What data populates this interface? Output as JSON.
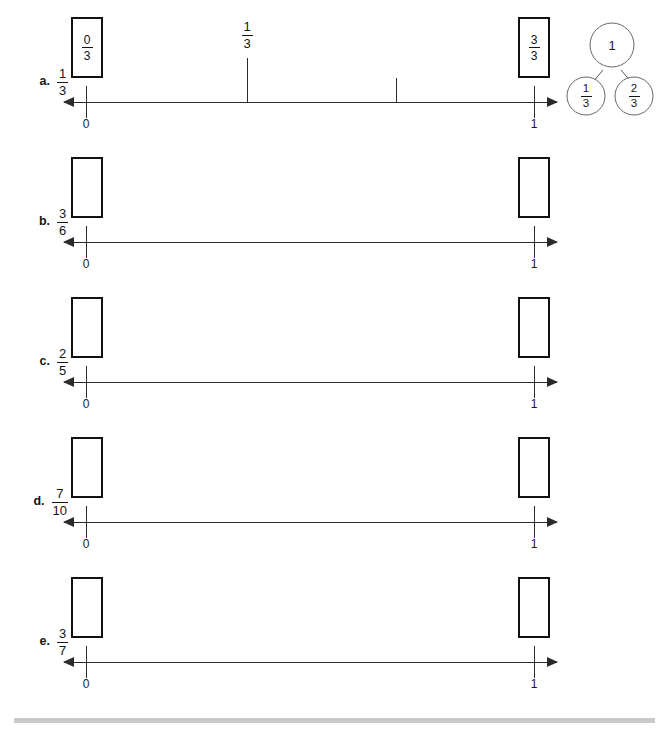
{
  "page": {
    "type": "fraction-number-line-worksheet",
    "endpoint_labels": {
      "zero": "0",
      "one": "1"
    },
    "footer_rule_color": "#c9c9c9"
  },
  "rows": [
    {
      "letter": "a.",
      "fraction": {
        "numerator": "1",
        "denominator": "3"
      },
      "box_left": {
        "filled": true,
        "numerator": "0",
        "denominator": "3"
      },
      "box_right": {
        "filled": true,
        "numerator": "3",
        "denominator": "3"
      },
      "interior_ticks": [
        {
          "label_numerator": "1",
          "label_denominator": "3",
          "labeled": true
        },
        {
          "labeled": false
        }
      ]
    },
    {
      "letter": "b.",
      "fraction": {
        "numerator": "3",
        "denominator": "6"
      },
      "box_left": {
        "filled": false
      },
      "box_right": {
        "filled": false
      },
      "interior_ticks": []
    },
    {
      "letter": "c.",
      "fraction": {
        "numerator": "2",
        "denominator": "5"
      },
      "box_left": {
        "filled": false
      },
      "box_right": {
        "filled": false
      },
      "interior_ticks": []
    },
    {
      "letter": "d.",
      "fraction": {
        "numerator": "7",
        "denominator": "10"
      },
      "box_left": {
        "filled": false
      },
      "box_right": {
        "filled": false
      },
      "interior_ticks": []
    },
    {
      "letter": "e.",
      "fraction": {
        "numerator": "3",
        "denominator": "7"
      },
      "box_left": {
        "filled": false
      },
      "box_right": {
        "filled": false
      },
      "interior_ticks": []
    }
  ],
  "number_bond": {
    "whole": "1",
    "part_left": {
      "numerator": "1",
      "denominator": "3"
    },
    "part_right": {
      "numerator": "2",
      "denominator": "3"
    }
  }
}
